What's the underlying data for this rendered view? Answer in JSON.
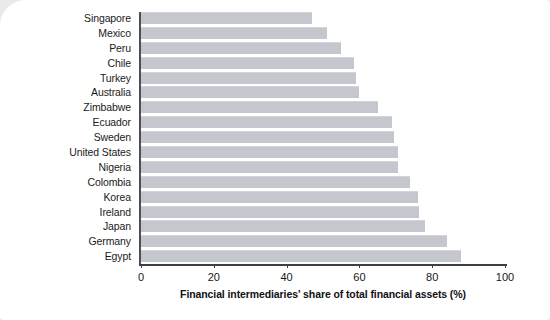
{
  "chart_data": {
    "type": "bar",
    "orientation": "horizontal",
    "title": "",
    "xlabel": "Financial intermediaries' share of total financial assets (%)",
    "ylabel": "",
    "xlim": [
      0,
      100
    ],
    "xticks": [
      "0",
      "20",
      "40",
      "60",
      "80",
      "100"
    ],
    "xtick_values": [
      0,
      20,
      40,
      60,
      80,
      100
    ],
    "grid": false,
    "legend": null,
    "bar_color": "#c4c7cd",
    "axis_color": "#3c3f46",
    "background_color": "#ffffff",
    "page_background_color": "#e9eaec",
    "categories": [
      "Singapore",
      "Mexico",
      "Peru",
      "Chile",
      "Turkey",
      "Australia",
      "Zimbabwe",
      "Ecuador",
      "Sweden",
      "United States",
      "Nigeria",
      "Colombia",
      "Korea",
      "Ireland",
      "Japan",
      "Germany",
      "Egypt"
    ],
    "values": [
      47,
      51,
      55,
      58.5,
      59,
      60,
      65,
      69,
      69.5,
      70.5,
      70.5,
      74,
      76,
      76.5,
      78,
      84,
      88
    ]
  }
}
